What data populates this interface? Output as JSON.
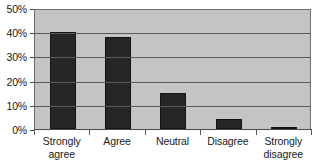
{
  "chart_data": {
    "type": "bar",
    "title": "",
    "subtitle": "",
    "xlabel": "",
    "ylabel": "",
    "categories": [
      "Strongly agree",
      "Agree",
      "Neutral",
      "Disagree",
      "Strongly disagree"
    ],
    "category_lines": [
      [
        "Strongly",
        "agree"
      ],
      [
        "Agree"
      ],
      [
        "Neutral"
      ],
      [
        "Disagree"
      ],
      [
        "Strongly",
        "disagree"
      ]
    ],
    "values": [
      40,
      38,
      15,
      4,
      1
    ],
    "value_unit": "%",
    "ylim": [
      0,
      50
    ],
    "ytick_values": [
      0,
      10,
      20,
      30,
      40,
      50
    ],
    "ytick_labels": [
      "0%",
      "10%",
      "20%",
      "30%",
      "40%",
      "50%"
    ],
    "grid": "horizontal",
    "legend": "none",
    "annotations": [],
    "colors": {
      "bar": "#262626",
      "bar_border": "#141414",
      "plot_background": "#c4c4c4",
      "plot_border": "#6e6e6e",
      "gridline": "#5a5a5a",
      "axis": "#4a4a4a",
      "text": "#1a1a1a",
      "page_background": "#ffffff"
    }
  }
}
